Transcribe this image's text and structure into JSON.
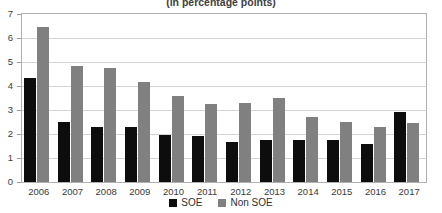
{
  "chart_data": {
    "type": "bar",
    "title": "(in percentage points)",
    "xlabel": "",
    "ylabel": "",
    "ylim": [
      0,
      7
    ],
    "ytick_step": 1,
    "yticks": [
      0,
      1,
      2,
      3,
      4,
      5,
      6,
      7
    ],
    "grid": true,
    "legend_position": "bottom",
    "categories": [
      "2006",
      "2007",
      "2008",
      "2009",
      "2010",
      "2011",
      "2012",
      "2013",
      "2014",
      "2015",
      "2016",
      "2017"
    ],
    "series": [
      {
        "name": "SOE",
        "color": "#0d0d0d",
        "values": [
          4.35,
          2.5,
          2.3,
          2.3,
          1.95,
          1.9,
          1.65,
          1.75,
          1.75,
          1.75,
          1.6,
          2.9
        ]
      },
      {
        "name": "Non SOE",
        "color": "#808080",
        "values": [
          6.45,
          4.85,
          4.75,
          4.15,
          3.6,
          3.25,
          3.3,
          3.5,
          2.7,
          2.5,
          2.3,
          2.45
        ]
      }
    ]
  },
  "legend": {
    "items": [
      {
        "label": "SOE",
        "color": "#0d0d0d"
      },
      {
        "label": "Non SOE",
        "color": "#808080"
      }
    ]
  }
}
